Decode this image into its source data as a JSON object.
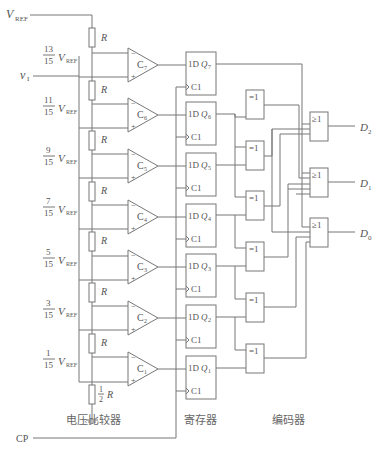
{
  "diagram": {
    "inputs": {
      "vref": "V",
      "vref_sub": "REF",
      "vi": "v",
      "vi_sub": "I",
      "cp": "CP"
    },
    "resistors": {
      "label": "R",
      "half_num": "1",
      "half_den": "2",
      "half_label": "R"
    },
    "taps": [
      {
        "num": "13",
        "den": "15"
      },
      {
        "num": "11",
        "den": "15"
      },
      {
        "num": "9",
        "den": "15"
      },
      {
        "num": "7",
        "den": "15"
      },
      {
        "num": "5",
        "den": "15"
      },
      {
        "num": "3",
        "den": "15"
      },
      {
        "num": "1",
        "den": "15"
      }
    ],
    "comparators": [
      {
        "name": "C",
        "sub": "7"
      },
      {
        "name": "C",
        "sub": "6"
      },
      {
        "name": "C",
        "sub": "5"
      },
      {
        "name": "C",
        "sub": "4"
      },
      {
        "name": "C",
        "sub": "3"
      },
      {
        "name": "C",
        "sub": "2"
      },
      {
        "name": "C",
        "sub": "1"
      }
    ],
    "flipflops": [
      {
        "d": "1D",
        "q": "Q",
        "sub": "7",
        "clk": "C1"
      },
      {
        "d": "1D",
        "q": "Q",
        "sub": "6",
        "clk": "C1"
      },
      {
        "d": "1D",
        "q": "Q",
        "sub": "5",
        "clk": "C1"
      },
      {
        "d": "1D",
        "q": "Q",
        "sub": "4",
        "clk": "C1"
      },
      {
        "d": "1D",
        "q": "Q",
        "sub": "3",
        "clk": "C1"
      },
      {
        "d": "1D",
        "q": "Q",
        "sub": "2",
        "clk": "C1"
      },
      {
        "d": "1D",
        "q": "Q",
        "sub": "1",
        "clk": "C1"
      }
    ],
    "xor_label": "=1",
    "or_label": "≥1",
    "outputs": [
      {
        "name": "D",
        "sub": "2"
      },
      {
        "name": "D",
        "sub": "1"
      },
      {
        "name": "D",
        "sub": "0"
      }
    ],
    "sections": {
      "comparator": "电压比较器",
      "register": "寄存器",
      "encoder": "编码器"
    },
    "minus": "−",
    "plus": "+"
  }
}
